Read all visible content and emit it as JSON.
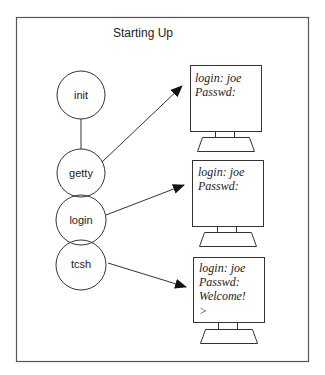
{
  "diagram": {
    "title": "Starting Up",
    "processes": [
      {
        "id": "init",
        "label": "init"
      },
      {
        "id": "getty",
        "label": "getty"
      },
      {
        "id": "login",
        "label": "login"
      },
      {
        "id": "tcsh",
        "label": "tcsh"
      }
    ],
    "terminals": [
      {
        "lines": [
          "login: joe",
          "Passwd:"
        ]
      },
      {
        "lines": [
          "login: joe",
          "Passwd:"
        ]
      },
      {
        "lines": [
          "login: joe",
          "Passwd:",
          "Welcome!",
          ">"
        ]
      }
    ],
    "edges": [
      {
        "from": "init",
        "to": "getty",
        "type": "line"
      },
      {
        "from": "getty",
        "to": "terminal-1",
        "type": "arrow"
      },
      {
        "from": "login",
        "to": "terminal-2",
        "type": "arrow"
      },
      {
        "from": "tcsh",
        "to": "terminal-3",
        "type": "arrow"
      }
    ],
    "colors": {
      "stroke": "#333333",
      "frame": "#555555",
      "background": "#ffffff"
    }
  }
}
